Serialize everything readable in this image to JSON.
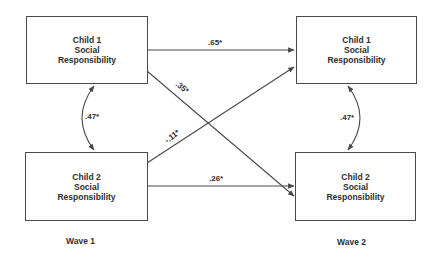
{
  "diagram": {
    "nodes": [
      {
        "id": "w1c1",
        "lines": [
          "Child 1",
          "Social",
          "Responsibility"
        ]
      },
      {
        "id": "w1c2",
        "lines": [
          "Child 2",
          "Social",
          "Responsibility"
        ]
      },
      {
        "id": "w2c1",
        "lines": [
          "Child 1",
          "Social",
          "Responsibility"
        ]
      },
      {
        "id": "w2c2",
        "lines": [
          "Child 2",
          "Social",
          "Responsibility"
        ]
      }
    ],
    "paths": {
      "c1_stability": ".65*",
      "c1_to_c2": ".35*",
      "c2_to_c1": "-.11*",
      "c2_stability": ".26*",
      "w1_covariance": ".47*",
      "w2_covariance": ".47*"
    },
    "waves": {
      "wave1": "Wave 1",
      "wave2": "Wave 2"
    }
  }
}
